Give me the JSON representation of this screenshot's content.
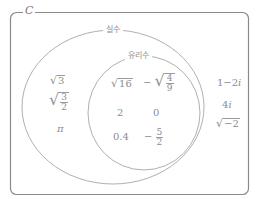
{
  "universe": {
    "label": "C"
  },
  "sets": {
    "real": {
      "label": "실수"
    },
    "rational": {
      "label": "유리수"
    }
  },
  "elements": {
    "rational": {
      "sqrt16": {
        "radicand": "16"
      },
      "neg_sqrt_4_9": {
        "sign": "−",
        "num": "4",
        "den": "9"
      },
      "two": "2",
      "zero": "0",
      "point4": "0.4",
      "neg_5_2": {
        "sign": "−",
        "num": "5",
        "den": "2"
      }
    },
    "irrational": {
      "sqrt3": {
        "radicand": "3"
      },
      "sqrt_3_2": {
        "num": "3",
        "den": "2"
      },
      "pi": "π"
    },
    "complex": {
      "one_minus_2i": "1−2",
      "one_minus_2i_unit": "i",
      "four_i": "4",
      "four_i_unit": "i",
      "sqrt_neg2": {
        "radicand": "−2"
      }
    }
  },
  "style": {
    "stroke": "#a8a8a8",
    "frame": "#8a8a8a",
    "text": "#8c8c8c"
  }
}
